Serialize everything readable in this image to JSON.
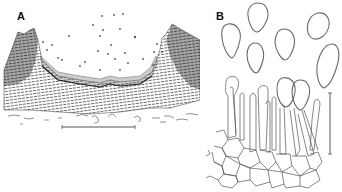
{
  "figure": {
    "panels": [
      {
        "label": "A",
        "description": "Section through cup-shaped ascoma showing hymenium, excipulum and scattered spores",
        "scale_bar": {
          "orientation": "horizontal",
          "x1": 62,
          "x2": 135,
          "y": 127
        }
      },
      {
        "label": "B",
        "description": "Ascospores and paraphyses / cells of hymenium",
        "scale_bar": {
          "orientation": "vertical",
          "x": 330,
          "y1": 93,
          "y2": 154
        },
        "spore_count": 6
      }
    ],
    "colors": {
      "ink": "#2a2a2a",
      "outline": "#6a6a6a",
      "background": "#ffffff"
    }
  }
}
